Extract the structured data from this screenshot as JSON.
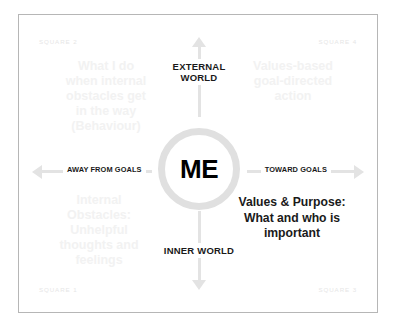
{
  "diagram": {
    "center": {
      "label": "ME"
    },
    "axes": {
      "vertical": {
        "top_label": "EXTERNAL\nWORLD",
        "bottom_label": "INNER\nWORLD"
      },
      "horizontal": {
        "left_label": "AWAY FROM GOALS",
        "right_label": "TOWARD GOALS"
      }
    },
    "quadrants": [
      {
        "corner_label": "SQUARE 2",
        "position": "top-left",
        "text": "What I do\nwhen internal\nobstacles get\nin the way\n(Behaviour)"
      },
      {
        "corner_label": "SQUARE 4",
        "position": "top-right",
        "text": "Values-based\ngoal-directed\naction"
      },
      {
        "corner_label": "SQUARE 1",
        "position": "bottom-left",
        "text": "Internal\nObstacles:\nUnhelpful\nthoughts and\nfeelings"
      },
      {
        "corner_label": "SQUARE 3",
        "position": "bottom-right",
        "text": "Values & Purpose:\nWhat and who is\nimportant"
      }
    ],
    "colors": {
      "background": "#ffffff",
      "border": "#b6b6b6",
      "axis": "#e3e3e3",
      "circle_ring": "#e0e0e0",
      "text_dark": "#1a1a1a",
      "text_faint": "#f2f2f2",
      "corner_label": "#e6e6e6"
    }
  }
}
